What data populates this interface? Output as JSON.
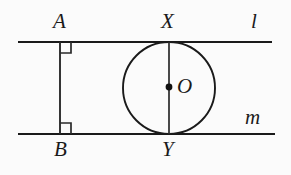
{
  "figure": {
    "background_color": "#fbfbfb",
    "stroke_color": "#1a1a1a",
    "labels": {
      "point_a": "A",
      "point_b": "B",
      "point_x": "X",
      "point_y": "Y",
      "center_o": "O",
      "line_l": "l",
      "line_m": "m"
    },
    "elements": {
      "line_l": {
        "name": "line-l",
        "x1": 18,
        "y1": 42,
        "x2": 272,
        "y2": 42
      },
      "line_m": {
        "name": "line-m",
        "x1": 18,
        "y1": 134,
        "x2": 275,
        "y2": 134
      },
      "segment_ab": {
        "name": "segment-ab",
        "x1": 60,
        "y1": 42,
        "x2": 60,
        "y2": 134
      },
      "segment_xy": {
        "name": "segment-xy",
        "x1": 169,
        "y1": 42,
        "x2": 169,
        "y2": 134
      },
      "circle_o": {
        "name": "circle-o",
        "cx": 169,
        "cy": 88,
        "r": 46
      },
      "center_dot": {
        "name": "center-point-o",
        "cx": 169,
        "cy": 87,
        "r": 3.4
      },
      "right_angle_a": {
        "name": "right-angle-mark-a",
        "x": 60,
        "y": 42,
        "size": 11
      },
      "right_angle_b": {
        "name": "right-angle-mark-b",
        "x": 60,
        "y": 134,
        "size": 11
      }
    }
  }
}
